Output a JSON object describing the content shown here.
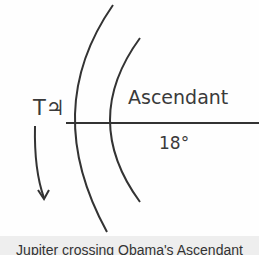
{
  "diagram": {
    "transit_label": "T♃",
    "ascendant_label": "Ascendant",
    "degree_label": "18°",
    "colors": {
      "line": "#333333",
      "text": "#3a3a3a",
      "caption_bg": "#eeeeee"
    }
  },
  "caption": "Jupiter crossing Obama's Ascendant"
}
